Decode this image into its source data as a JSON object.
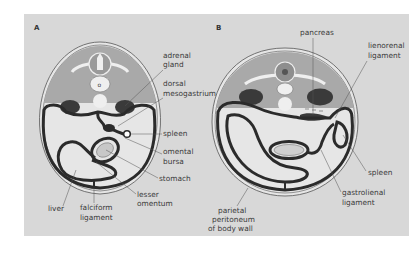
{
  "figure": {
    "panel_a": {
      "letter": "A",
      "labels": {
        "adrenal_1": "adrenal",
        "adrenal_2": "gland",
        "dorsal_1": "dorsal",
        "dorsal_2": "mesogastrium",
        "spleen": "spleen",
        "omental_1": "omental",
        "omental_2": "bursa",
        "stomach": "stomach",
        "lesser_1": "lesser",
        "lesser_2": "omentum",
        "liver": "liver",
        "falciform_1": "falciform",
        "falciform_2": "ligament"
      }
    },
    "panel_b": {
      "letter": "B",
      "labels": {
        "pancreas": "pancreas",
        "lienorenal_1": "lienorenal",
        "lienorenal_2": "ligament",
        "spleen": "spleen",
        "gastrolienal_1": "gastrolienal",
        "gastrolienal_2": "ligament",
        "parietal_1": "parietal",
        "parietal_2": "peritoneum",
        "parietal_3": "of body wall"
      }
    },
    "colors": {
      "background": "#d8d8d8",
      "dorsal_wall": "#a9a9a9",
      "cavity": "#e6e6e6",
      "peritoneum": "#2b2b2b",
      "organ_dark": "#3a3a3a",
      "bone": "#efefef",
      "leader": "#555555"
    }
  }
}
